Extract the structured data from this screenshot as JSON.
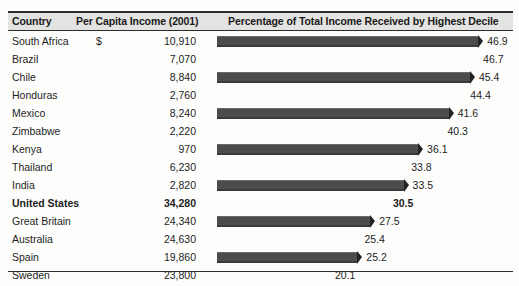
{
  "table": {
    "headers": {
      "country": "Country",
      "income": "Per Capita Income (2001)",
      "percentage": "Percentage of Total Income Received by Highest Decile"
    }
  },
  "chart_data": {
    "type": "bar",
    "title": "Percentage of Total Income Received by Highest Decile",
    "xlabel": "",
    "ylabel": "Country",
    "xlim": [
      0,
      50
    ],
    "grid": false,
    "legend": null,
    "categories": [
      "South Africa",
      "Brazil",
      "Chile",
      "Honduras",
      "Mexico",
      "Zimbabwe",
      "Kenya",
      "Thailand",
      "India",
      "United States",
      "Great Britain",
      "Australia",
      "Spain",
      "Sweden"
    ],
    "values": [
      46.9,
      46.7,
      45.4,
      44.4,
      41.6,
      40.3,
      36.1,
      33.8,
      33.5,
      30.5,
      27.5,
      25.4,
      25.2,
      20.1
    ],
    "secondary_series": {
      "name": "Per Capita Income (2001)",
      "unit": "USD",
      "values": [
        10910,
        7070,
        8840,
        2760,
        8240,
        2220,
        970,
        6230,
        2820,
        34280,
        24340,
        24630,
        19860,
        23800
      ]
    }
  },
  "rows": [
    {
      "country": "South Africa",
      "currency": "$",
      "income": "10,910",
      "value": "46.9",
      "value_num": 46.9,
      "bar": true,
      "bold": false
    },
    {
      "country": "Brazil",
      "currency": "",
      "income": "7,070",
      "value": "46.7",
      "value_num": 46.7,
      "bar": false,
      "bold": false
    },
    {
      "country": "Chile",
      "currency": "",
      "income": "8,840",
      "value": "45.4",
      "value_num": 45.4,
      "bar": true,
      "bold": false
    },
    {
      "country": "Honduras",
      "currency": "",
      "income": "2,760",
      "value": "44.4",
      "value_num": 44.4,
      "bar": false,
      "bold": false
    },
    {
      "country": "Mexico",
      "currency": "",
      "income": "8,240",
      "value": "41.6",
      "value_num": 41.6,
      "bar": true,
      "bold": false
    },
    {
      "country": "Zimbabwe",
      "currency": "",
      "income": "2,220",
      "value": "40.3",
      "value_num": 40.3,
      "bar": false,
      "bold": false
    },
    {
      "country": "Kenya",
      "currency": "",
      "income": "970",
      "value": "36.1",
      "value_num": 36.1,
      "bar": true,
      "bold": false
    },
    {
      "country": "Thailand",
      "currency": "",
      "income": "6,230",
      "value": "33.8",
      "value_num": 33.8,
      "bar": false,
      "bold": false
    },
    {
      "country": "India",
      "currency": "",
      "income": "2,820",
      "value": "33.5",
      "value_num": 33.5,
      "bar": true,
      "bold": false
    },
    {
      "country": "United States",
      "currency": "",
      "income": "34,280",
      "value": "30.5",
      "value_num": 30.5,
      "bar": false,
      "bold": true
    },
    {
      "country": "Great Britain",
      "currency": "",
      "income": "24,340",
      "value": "27.5",
      "value_num": 27.5,
      "bar": true,
      "bold": false
    },
    {
      "country": "Australia",
      "currency": "",
      "income": "24,630",
      "value": "25.4",
      "value_num": 25.4,
      "bar": false,
      "bold": false
    },
    {
      "country": "Spain",
      "currency": "",
      "income": "19,860",
      "value": "25.2",
      "value_num": 25.2,
      "bar": true,
      "bold": false
    },
    {
      "country": "Sweden",
      "currency": "",
      "income": "23,800",
      "value": "20.1",
      "value_num": 20.1,
      "bar": false,
      "bold": false
    }
  ],
  "layout": {
    "bar_origin_x": 217,
    "px_per_unit": 5.57,
    "row_height": 18,
    "first_row_top": 33
  }
}
